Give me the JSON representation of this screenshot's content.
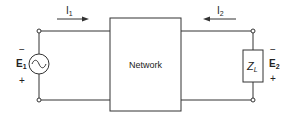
{
  "diagram": {
    "type": "two-port network circuit",
    "network_label": "Network",
    "source": {
      "label": "E",
      "subscript": "1",
      "symbol": "ac-source",
      "top_sign": "−",
      "bottom_sign": "+"
    },
    "load": {
      "label": "Z",
      "subscript": "L",
      "voltage_label": "E",
      "voltage_subscript": "2",
      "top_sign": "−",
      "bottom_sign": "+"
    },
    "currents": [
      {
        "label": "I",
        "subscript": "1",
        "direction": "right"
      },
      {
        "label": "I",
        "subscript": "2",
        "direction": "left"
      }
    ],
    "colors": {
      "line": "#333333",
      "background": "#ffffff"
    }
  }
}
